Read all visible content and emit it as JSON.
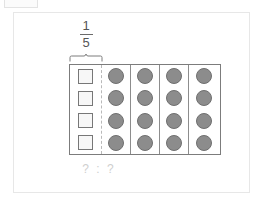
{
  "artifact": {
    "name": "clipped-rectangle"
  },
  "card": {
    "background": "#ffffff",
    "border_color": "#e7e7e7"
  },
  "diagram": {
    "fraction": {
      "numerator": "1",
      "denominator": "5",
      "label": "1/5"
    },
    "brace": {
      "spans_column": 1,
      "direction": "up"
    },
    "grid": {
      "columns": 5,
      "rows": 4,
      "border_color": "#7c7c7c",
      "column_types": [
        "squares",
        "dots",
        "dots",
        "dots",
        "dots"
      ],
      "square": {
        "fill": "#f7f7f7",
        "border": "#777777",
        "count": 4
      },
      "dot": {
        "fill": "#8c8c8c",
        "border": "#6f6f6f",
        "count_per_column": 4,
        "total": 16
      },
      "separator_after_first_column": "dashed",
      "separator_between_dot_columns": "solid"
    },
    "answer_prompt": {
      "text": "? : ?",
      "color": "#cfcfcf"
    }
  }
}
